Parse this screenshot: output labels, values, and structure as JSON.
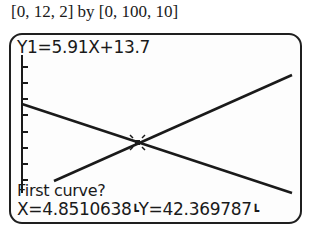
{
  "window": {
    "caption": "[0, 12, 2] by [0, 100, 10]"
  },
  "window_settings": {
    "xmin": 0,
    "xmax": 12,
    "xscl": 2,
    "ymin": 0,
    "ymax": 100,
    "yscl": 10
  },
  "screen": {
    "equation_label": "Y1=5.91X+13.7",
    "prompt": "First curve?",
    "x_readout": "X=4.8510638",
    "y_readout": "Y=42.369787",
    "cursor_glyph": "┗"
  },
  "graph": {
    "lines": [
      {
        "name": "Y1",
        "expression": "5.91X+13.7",
        "slope": "increasing"
      },
      {
        "name": "Y2",
        "slope": "decreasing"
      }
    ],
    "intersection": {
      "x": "4.8510638",
      "y": "42.369787"
    },
    "line_color": "#1a1a1a",
    "axis_color": "#1a1a1a"
  }
}
